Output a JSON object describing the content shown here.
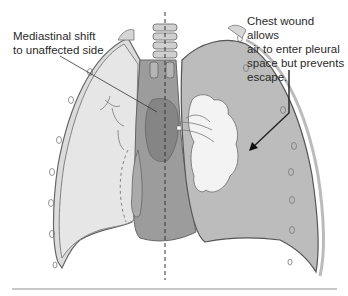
{
  "diagram": {
    "labels": {
      "mediastinal_shift": "Mediastinal shift\nto unaffected side",
      "chest_wound": "Chest wound allows\nair to enter pleural\nspace but prevents\nescape."
    },
    "colors": {
      "background": "#ffffff",
      "unaffected_lung": "#e4e4e4",
      "affected_pleural_space": "#bdbdbd",
      "mediastinum": "#9a9a9a",
      "heart": "#8a8a8a",
      "collapsed_lung": "#f2f2f2",
      "outline": "#555555",
      "rib_wall": "#cfcfcf",
      "divider": "#c8c8c8"
    }
  }
}
